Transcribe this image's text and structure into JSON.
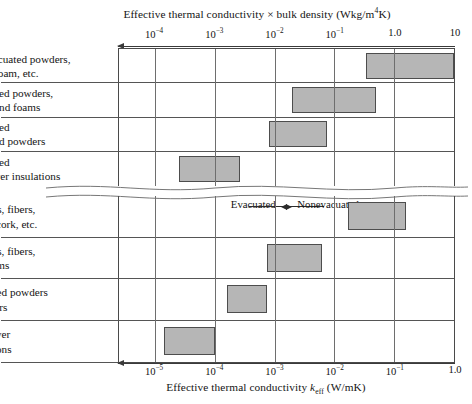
{
  "chart_data": {
    "type": "bar",
    "orientation": "horizontal",
    "title": "",
    "panels": [
      {
        "id": "top",
        "axis": {
          "label_prefix": "Effective thermal conductivity ",
          "label_times": "×",
          "label_suffix": " bulk density (Wkg/m",
          "label_exponent": "4",
          "label_tail": "K)",
          "full_label": "Effective thermal conductivity × bulk density (Wkg/m⁴K)",
          "scale": "log10",
          "direction": "right-to-left-arrow",
          "min_exp": -4.6,
          "max_exp": 1.0,
          "ticks": [
            {
              "label_mantissa": "10",
              "label_exp": "-4",
              "value_exp": -4
            },
            {
              "label_mantissa": "10",
              "label_exp": "-3",
              "value_exp": -3
            },
            {
              "label_mantissa": "10",
              "label_exp": "-2",
              "value_exp": -2
            },
            {
              "label_mantissa": "10",
              "label_exp": "-1",
              "value_exp": -1
            },
            {
              "label_mantissa": "1.0",
              "label_exp": "",
              "value_exp": 0
            },
            {
              "label_mantissa": "10",
              "label_exp": "",
              "value_exp": 1
            }
          ]
        },
        "rows": [
          {
            "label": "Nonevacuated powders,\nfibers, foam, etc.",
            "start_exp": -0.47,
            "end_exp": 1.0
          },
          {
            "label": "Evacuated powders,\nfibers, and foams",
            "start_exp": -1.7,
            "end_exp": -0.3
          },
          {
            "label": "Evacuated\nopacified powders",
            "start_exp": -2.1,
            "end_exp": -1.13
          },
          {
            "label": "Evacuated\nmultilayer insulations",
            "start_exp": -3.6,
            "end_exp": -2.58
          }
        ]
      },
      {
        "id": "bottom",
        "axis": {
          "label_prefix": "Effective thermal conductivity ",
          "label_symbol": "k",
          "label_sub": "eff",
          "label_tail": " (W/mK)",
          "full_label": "Effective thermal conductivity k_eff (W/mK)",
          "scale": "log10",
          "direction": "right-to-left-arrow",
          "min_exp": -5.6,
          "max_exp": 0.0,
          "ticks": [
            {
              "label_mantissa": "10",
              "label_exp": "-5",
              "value_exp": -5
            },
            {
              "label_mantissa": "10",
              "label_exp": "-4",
              "value_exp": -4
            },
            {
              "label_mantissa": "10",
              "label_exp": "-3",
              "value_exp": -3
            },
            {
              "label_mantissa": "10",
              "label_exp": "-2",
              "value_exp": -2
            },
            {
              "label_mantissa": "10",
              "label_exp": "-1",
              "value_exp": -1
            },
            {
              "label_mantissa": "1.0",
              "label_exp": "",
              "value_exp": 0
            }
          ]
        },
        "rows": [
          {
            "label": "Powders, fibers,\nfoams, cork, etc.",
            "start_exp": -1.78,
            "end_exp": -0.8
          },
          {
            "label": "Powders, fibers,\nand foams",
            "start_exp": -3.12,
            "end_exp": -2.2
          },
          {
            "label": "Opacified powders\nand fibers",
            "start_exp": -3.8,
            "end_exp": -3.13
          },
          {
            "label": "Multilayer\ninsulations",
            "start_exp": -4.85,
            "end_exp": -4.0
          }
        ]
      }
    ],
    "annotations": {
      "evacuated": "Evacuated",
      "nonevacuated": "Nonevacuated"
    },
    "style": {
      "bar_fill": "#b6b6b6",
      "bar_stroke": "#4d4d4d",
      "grid_color": "#6e6e6e",
      "frame_color": "#4a4a4a",
      "background": "#ffffff"
    },
    "grid": true,
    "legend": "none"
  }
}
